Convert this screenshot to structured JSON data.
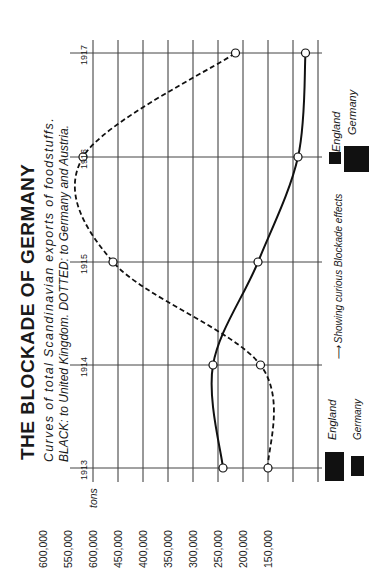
{
  "chart_data": {
    "type": "line",
    "orientation": "rotated 90deg counter-clockwise (years run bottom-to-top, tonnage runs left-to-right decreasing)",
    "title": "THE BLOCKADE OF GERMANY",
    "subtitle": "Curves of total Scandinavian exports of foodstuffs.",
    "subtitle2": "BLACK: to United Kingdom. DOTTED: to Germany and Austria.",
    "xlabel": "",
    "ylabel": "tons",
    "categories": [
      "1913",
      "1914",
      "1915",
      "1916",
      "1917"
    ],
    "ylim": [
      150000,
      600000
    ],
    "y_ticks": [
      "600,000",
      "550,000",
      "600,000",
      "450,000",
      "400,000",
      "350,000",
      "300,000",
      "250,000",
      "200,000",
      "150,000"
    ],
    "y_tick_values": [
      600000,
      550000,
      500000,
      450000,
      400000,
      350000,
      300000,
      250000,
      200000,
      150000
    ],
    "grid": true,
    "series": [
      {
        "name": "To United Kingdom (black, solid)",
        "style": "solid",
        "values": [
          340000,
          360000,
          270000,
          190000,
          175000
        ]
      },
      {
        "name": "To Germany and Austria (dotted)",
        "style": "dashed",
        "values": [
          250000,
          265000,
          560000,
          620000,
          315000
        ]
      }
    ],
    "legend": {
      "position": "bottom-right and right side",
      "items_1913": [
        {
          "label": "England",
          "size": "large"
        },
        {
          "label": "Germany",
          "size": "small"
        }
      ],
      "items_1916": [
        {
          "label": "England",
          "size": "small"
        },
        {
          "label": "Germany",
          "size": "large"
        }
      ],
      "annotation": "Showing curious Blockade effects"
    }
  },
  "axis": {
    "unit_label": "tons",
    "ditto_marks": [
      "\"",
      "\"",
      "\"",
      "\"",
      "\"",
      "\"",
      "\"",
      "\"",
      "\""
    ]
  }
}
